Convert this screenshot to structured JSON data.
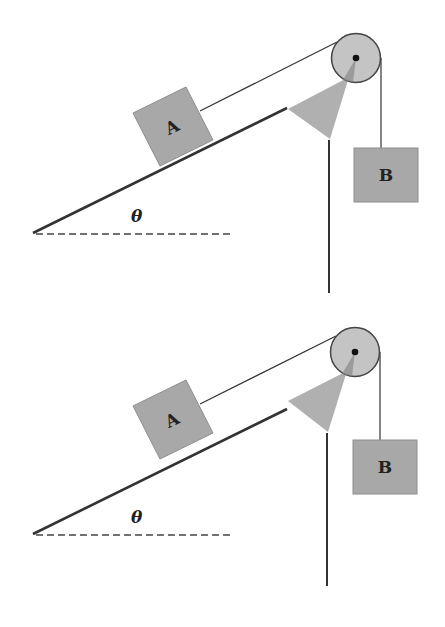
{
  "diagrams": [
    {
      "name": "upper-diagram",
      "offset_y": 0,
      "block_a_label": "A",
      "block_b_label": "B",
      "angle_label": "θ"
    },
    {
      "name": "lower-diagram",
      "offset_y": 301,
      "block_a_label": "A",
      "block_b_label": "B",
      "angle_label": "θ"
    }
  ],
  "colors": {
    "block_fill": "#a8a8a8",
    "block_stroke": "#8e8e8e",
    "pulley_fill": "#c4c4c4",
    "pulley_stroke": "#444444",
    "support_fill": "#b0b0b0",
    "line": "#333333",
    "axle": "#111111"
  }
}
